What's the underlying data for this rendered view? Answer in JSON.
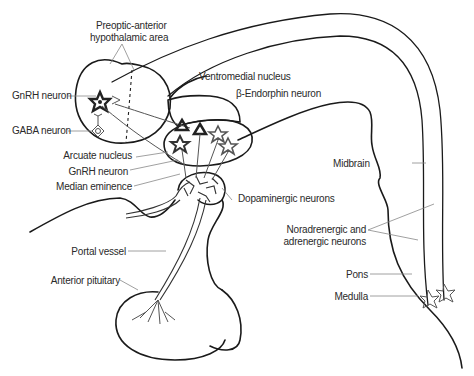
{
  "diagram": {
    "labels": {
      "preoptic_line1": "Preoptic-anterior",
      "preoptic_line2": "hypothalamic area",
      "gnrh_neuron_top": "GnRH neuron",
      "gaba_neuron": "GABA neuron",
      "ventromedial": "Ventromedial nucleus",
      "beta_endorphin": "β-Endorphin neuron",
      "arcuate": "Arcuate nucleus",
      "gnrh_neuron_bottom": "GnRH neuron",
      "median_eminence": "Median eminence",
      "dopaminergic": "Dopaminergic neurons",
      "midbrain": "Midbrain",
      "noradrenergic_line1": "Noradrenergic and",
      "noradrenergic_line2": "adrenergic neurons",
      "portal_vessel": "Portal vessel",
      "anterior_pituitary": "Anterior pituitary",
      "pons": "Pons",
      "medulla": "Medulla"
    },
    "colors": {
      "outline": "#1a1a1a",
      "leader": "#888888",
      "text": "#2a2a2a",
      "background": "#ffffff"
    }
  }
}
